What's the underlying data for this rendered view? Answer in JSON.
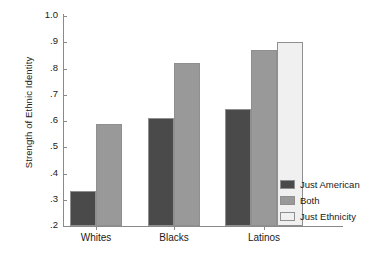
{
  "chart_data": {
    "type": "bar",
    "title": "",
    "xlabel": "",
    "ylabel": "Strength of Ethnic Identity",
    "categories": [
      "Whites",
      "Blacks",
      "Latinos"
    ],
    "series": [
      {
        "name": "Just American",
        "color": "#4a4a4a",
        "values": [
          0.335,
          0.61,
          0.645
        ]
      },
      {
        "name": "Both",
        "color": "#999999",
        "values": [
          0.59,
          0.82,
          0.87
        ]
      },
      {
        "name": "Just Ethnicity",
        "color": "#f0f0f0",
        "values": [
          null,
          null,
          0.9
        ]
      }
    ],
    "ylim": [
      0.2,
      1.0
    ],
    "yticks": [
      1.0,
      0.9,
      0.8,
      0.7,
      0.6,
      0.5,
      0.4,
      0.3,
      0.2
    ],
    "ytick_labels": [
      "1.0",
      ".9",
      ".8",
      ".7",
      ".6",
      ".5",
      ".4",
      ".3",
      ".2"
    ],
    "grid": false,
    "legend_position": "right",
    "legend_entries": [
      "Just American",
      "Both",
      "Just Ethnicity"
    ]
  }
}
